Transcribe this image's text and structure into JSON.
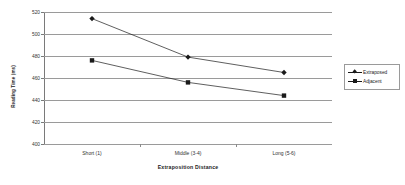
{
  "chart_data": {
    "type": "line",
    "title": "",
    "xlabel": "Extraposition Distance",
    "ylabel": "Reading Time (ms)",
    "categories": [
      "Short (1)",
      "Middle (3-4)",
      "Long (5-6)"
    ],
    "ylim": [
      400,
      520
    ],
    "yticks": [
      400,
      420,
      440,
      460,
      480,
      500,
      520
    ],
    "ytick_labels": [
      "400",
      "420",
      "440",
      "460",
      "480",
      "500",
      "520"
    ],
    "grid": true,
    "legend_position": "right",
    "series": [
      {
        "name": "Extraposed",
        "marker": "diamond",
        "color": "#1a1a1a",
        "values": [
          514,
          479,
          465
        ]
      },
      {
        "name": "Adjacent",
        "marker": "square",
        "color": "#1a1a1a",
        "values": [
          476,
          456,
          444
        ]
      }
    ]
  },
  "axes": {
    "y_title": "Reading Time (ms)",
    "x_title": "Extraposition Distance"
  },
  "legend": {
    "entries": [
      {
        "label": "Extraposed",
        "marker": "diamond-marker-icon"
      },
      {
        "label": "Adjacent",
        "marker": "square-marker-icon"
      }
    ]
  }
}
